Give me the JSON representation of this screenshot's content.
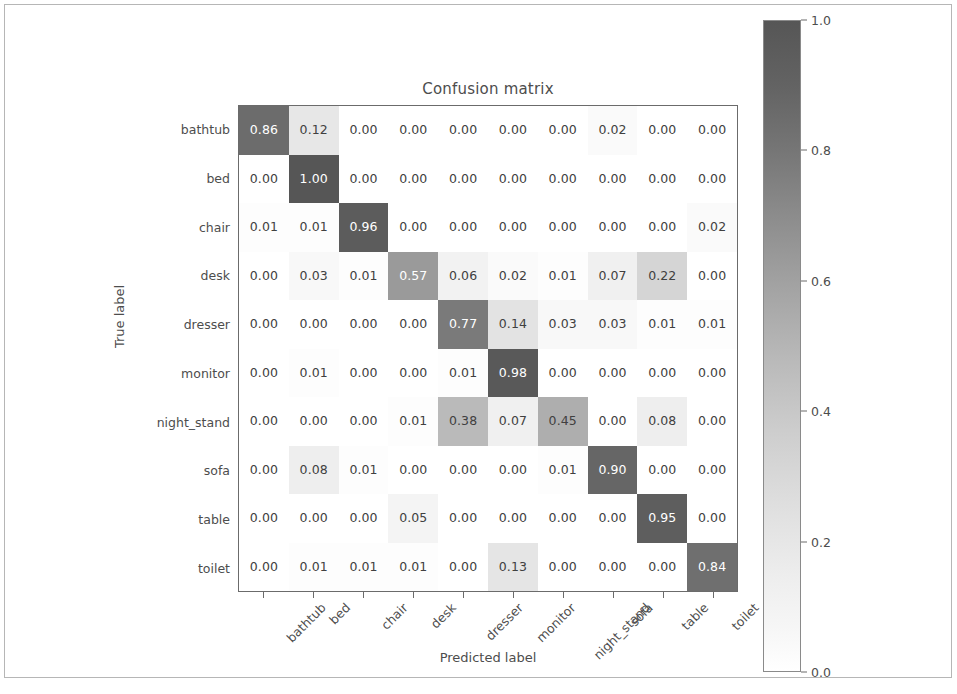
{
  "chart_data": {
    "type": "heatmap",
    "title": "Confusion matrix",
    "xlabel": "Predicted label",
    "ylabel": "True label",
    "categories": [
      "bathtub",
      "bed",
      "chair",
      "desk",
      "dresser",
      "monitor",
      "night_stand",
      "sofa",
      "table",
      "toilet"
    ],
    "x_tick_labels": [
      "bathtub",
      "bed",
      "chair",
      "desk",
      "dresser",
      "monitor",
      "night_stand",
      "sofa",
      "table",
      "toilet"
    ],
    "y_tick_labels": [
      "bathtub",
      "bed",
      "chair",
      "desk",
      "dresser",
      "monitor",
      "night_stand",
      "sofa",
      "table",
      "toilet"
    ],
    "values": [
      [
        0.86,
        0.12,
        0.0,
        0.0,
        0.0,
        0.0,
        0.0,
        0.02,
        0.0,
        0.0
      ],
      [
        0.0,
        1.0,
        0.0,
        0.0,
        0.0,
        0.0,
        0.0,
        0.0,
        0.0,
        0.0
      ],
      [
        0.01,
        0.01,
        0.96,
        0.0,
        0.0,
        0.0,
        0.0,
        0.0,
        0.0,
        0.02
      ],
      [
        0.0,
        0.03,
        0.01,
        0.57,
        0.06,
        0.02,
        0.01,
        0.07,
        0.22,
        0.0
      ],
      [
        0.0,
        0.0,
        0.0,
        0.0,
        0.77,
        0.14,
        0.03,
        0.03,
        0.01,
        0.01
      ],
      [
        0.0,
        0.01,
        0.0,
        0.0,
        0.01,
        0.98,
        0.0,
        0.0,
        0.0,
        0.0
      ],
      [
        0.0,
        0.0,
        0.0,
        0.01,
        0.38,
        0.07,
        0.45,
        0.0,
        0.08,
        0.0
      ],
      [
        0.0,
        0.08,
        0.01,
        0.0,
        0.0,
        0.0,
        0.01,
        0.9,
        0.0,
        0.0
      ],
      [
        0.0,
        0.0,
        0.0,
        0.05,
        0.0,
        0.0,
        0.0,
        0.0,
        0.95,
        0.0
      ],
      [
        0.0,
        0.01,
        0.01,
        0.01,
        0.0,
        0.13,
        0.0,
        0.0,
        0.0,
        0.84
      ]
    ],
    "cell_labels": [
      [
        "0.86",
        "0.12",
        "0.00",
        "0.00",
        "0.00",
        "0.00",
        "0.00",
        "0.02",
        "0.00",
        "0.00"
      ],
      [
        "0.00",
        "1.00",
        "0.00",
        "0.00",
        "0.00",
        "0.00",
        "0.00",
        "0.00",
        "0.00",
        "0.00"
      ],
      [
        "0.01",
        "0.01",
        "0.96",
        "0.00",
        "0.00",
        "0.00",
        "0.00",
        "0.00",
        "0.00",
        "0.02"
      ],
      [
        "0.00",
        "0.03",
        "0.01",
        "0.57",
        "0.06",
        "0.02",
        "0.01",
        "0.07",
        "0.22",
        "0.00"
      ],
      [
        "0.00",
        "0.00",
        "0.00",
        "0.00",
        "0.77",
        "0.14",
        "0.03",
        "0.03",
        "0.01",
        "0.01"
      ],
      [
        "0.00",
        "0.01",
        "0.00",
        "0.00",
        "0.01",
        "0.98",
        "0.00",
        "0.00",
        "0.00",
        "0.00"
      ],
      [
        "0.00",
        "0.00",
        "0.00",
        "0.01",
        "0.38",
        "0.07",
        "0.45",
        "0.00",
        "0.08",
        "0.00"
      ],
      [
        "0.00",
        "0.08",
        "0.01",
        "0.00",
        "0.00",
        "0.00",
        "0.01",
        "0.90",
        "0.00",
        "0.00"
      ],
      [
        "0.00",
        "0.00",
        "0.00",
        "0.05",
        "0.00",
        "0.00",
        "0.00",
        "0.00",
        "0.95",
        "0.00"
      ],
      [
        "0.00",
        "0.01",
        "0.01",
        "0.01",
        "0.00",
        "0.13",
        "0.00",
        "0.00",
        "0.00",
        "0.84"
      ]
    ],
    "colormap": "Greys",
    "colorbar": {
      "ticks": [
        "1.0",
        "0.8",
        "0.6",
        "0.4",
        "0.2",
        "0.0"
      ],
      "tick_values": [
        1.0,
        0.8,
        0.6,
        0.4,
        0.2,
        0.0
      ],
      "vmin": 0.0,
      "vmax": 1.0,
      "position": "right",
      "low_color": "#ffffff",
      "high_color": "#565656"
    },
    "grid": false,
    "text_color_dark": "#404040",
    "text_color_light": "#ffffff"
  }
}
